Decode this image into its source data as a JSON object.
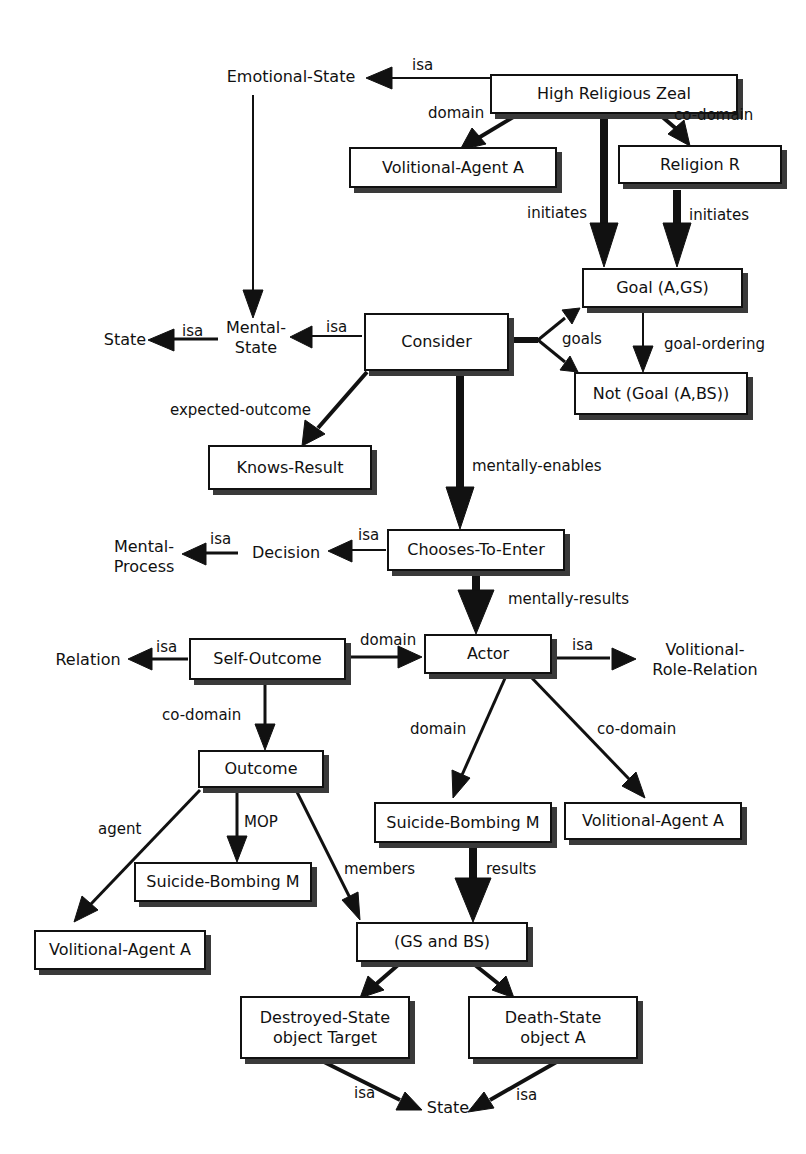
{
  "nodes": {
    "high_religious_zeal": "High Religious Zeal",
    "volitional_agent_top": "Volitional-Agent A",
    "religion_r": "Religion R",
    "goal_a_gs": "Goal (A,GS)",
    "consider": "Consider",
    "not_goal_a_bs": "Not (Goal (A,BS))",
    "knows_result": "Knows-Result",
    "chooses_to_enter": "Chooses-To-Enter",
    "self_outcome": "Self-Outcome",
    "actor": "Actor",
    "outcome": "Outcome",
    "suicide_bombing_right": "Suicide-Bombing M",
    "volitional_agent_right": "Volitional-Agent A",
    "suicide_bombing_left": "Suicide-Bombing M",
    "volitional_agent_left": "Volitional-Agent A",
    "gs_and_bs": "(GS and BS)",
    "destroyed_state": "Destroyed-State\nobject Target",
    "death_state": "Death-State\nobject A"
  },
  "concepts": {
    "emotional_state": "Emotional-State",
    "mental_state": "Mental-\nState",
    "state_top": "State",
    "mental_process": "Mental-\nProcess",
    "decision": "Decision",
    "relation": "Relation",
    "volitional_role_relation": "Volitional-\nRole-Relation",
    "state_bottom": "State"
  },
  "edge_labels": {
    "isa_zeal": "isa",
    "domain_zeal": "domain",
    "codomain_zeal": "co-domain",
    "initiates_zeal": "initiates",
    "initiates_religion": "initiates",
    "isa_mental_state": "isa",
    "isa_consider": "isa",
    "goals": "goals",
    "goal_ordering": "goal-ordering",
    "expected_outcome": "expected-outcome",
    "mentally_enables": "mentally-enables",
    "isa_decision": "isa",
    "isa_chooses": "isa",
    "mentally_results": "mentally-results",
    "isa_self_outcome": "isa",
    "domain_self_outcome": "domain",
    "isa_actor": "isa",
    "codomain_self_outcome": "co-domain",
    "domain_actor": "domain",
    "codomain_actor": "co-domain",
    "agent": "agent",
    "mop": "MOP",
    "members": "members",
    "results": "results",
    "isa_destroyed": "isa",
    "isa_death": "isa"
  },
  "colors": {
    "ink": "#111111",
    "shadow": "#3a3a3a",
    "background": "#ffffff"
  }
}
